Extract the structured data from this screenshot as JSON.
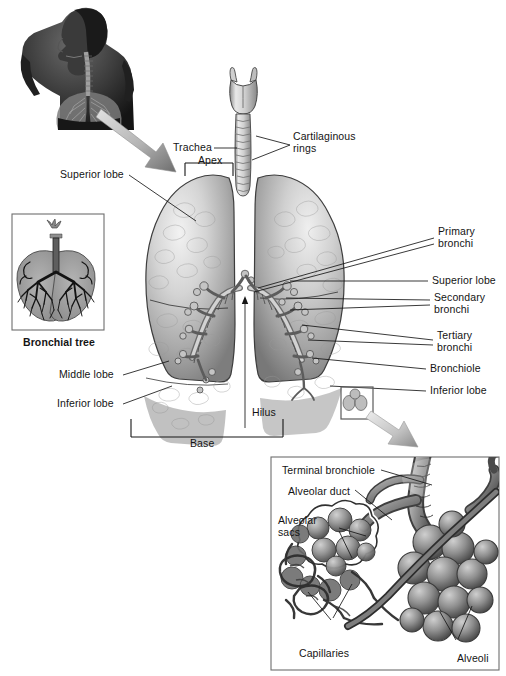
{
  "figure": {
    "background_color": "#ffffff",
    "text_color": "#141414"
  },
  "labels": {
    "trachea": "Trachea",
    "cartilaginous_rings": "Cartilaginous\nrings",
    "apex": "Apex",
    "superior_lobe_left": "Superior lobe",
    "primary_bronchi": "Primary\nbronchi",
    "superior_lobe_right": "Superior lobe",
    "secondary_bronchi": "Secondary\nbronchi",
    "tertiary_bronchi": "Tertiary\nbronchi",
    "bronchiole": "Bronchiole",
    "inferior_lobe_right": "Inferior lobe",
    "middle_lobe": "Middle lobe",
    "inferior_lobe_left": "Inferior lobe",
    "hilus": "Hilus",
    "base": "Base",
    "bronchial_tree": "Bronchial tree"
  },
  "inset": {
    "terminal_bronchiole": "Terminal bronchiole",
    "alveolar_duct": "Alveolar duct",
    "alveolar_sacs": "Alveolar\nsacs",
    "capillaries": "Capillaries",
    "alveoli": "Alveoli"
  },
  "panels": {
    "torso": {
      "name": "Human torso with lungs in situ"
    },
    "bronchial_tree_box": {
      "name": "Bronchial tree cast"
    },
    "alveoli_box": {
      "name": "Alveoli magnified detail"
    }
  },
  "colors": {
    "lung_light": "#d9d9d9",
    "lung_mid": "#a8a8a8",
    "lung_dark": "#6f6f6f",
    "outline": "#3a3a3a",
    "arrow_light": "#cfcfcf",
    "arrow_dark": "#767676",
    "box_border": "#6e6e6e",
    "tree_fill": "#9a9a9a",
    "tree_branch": "#1c1c1c",
    "skin_dark": "#2a2a2a",
    "inset_bg": "#ffffff"
  }
}
